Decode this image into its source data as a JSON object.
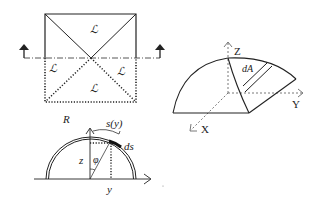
{
  "figure_top_left": {
    "title": "plan-view-square",
    "region_labels": [
      "ℒ",
      "ℒ",
      "ℒ",
      "ℒ"
    ],
    "section_arrows": 2
  },
  "figure_right": {
    "title": "dome-3d",
    "axes": {
      "z": "Z",
      "y": "Y",
      "x": "X"
    },
    "area_element": "dA"
  },
  "figure_bottom_left": {
    "title": "cross-section",
    "radius_label": "R",
    "arc_length_label": "s(y)",
    "arc_element_label": "ds",
    "height_label": "z",
    "angle_label": "φ",
    "horizontal_label": "y"
  },
  "colors": {
    "line": "#222222",
    "dashed": "#555555",
    "background": "#ffffff"
  }
}
